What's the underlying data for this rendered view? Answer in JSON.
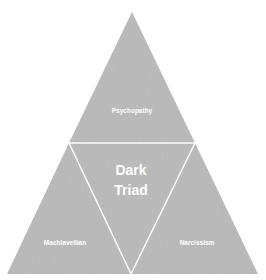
{
  "diagram": {
    "title": "Dark Triad",
    "center_label": {
      "line1": "Dark",
      "line2": "Triad"
    },
    "segments": [
      {
        "id": "top",
        "label": "Psychopathy"
      },
      {
        "id": "bottom-left",
        "label": "Machiavellian"
      },
      {
        "id": "bottom-right",
        "label": "Narcissism"
      }
    ],
    "colors": {
      "fill": "#b9b9b9",
      "divider": "#ffffff",
      "text": "#ffffff",
      "background": "#ffffff"
    }
  }
}
